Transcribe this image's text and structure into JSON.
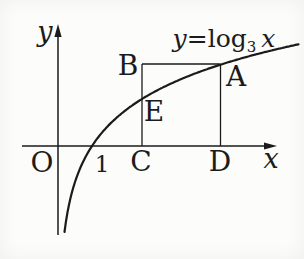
{
  "colors": {
    "ink": "#1b1b1b",
    "background": "#fcfcfa"
  },
  "axes": {
    "x_label": "x",
    "y_label": "y",
    "origin_label": "O",
    "unit_tick_label": "1"
  },
  "equation": {
    "lhs": "y",
    "relation": "=",
    "function_name": "log",
    "base": "3",
    "argument": "x",
    "full_text": "y=log₃x"
  },
  "points": {
    "A": "A",
    "B": "B",
    "C": "C",
    "D": "D",
    "E": "E"
  }
}
